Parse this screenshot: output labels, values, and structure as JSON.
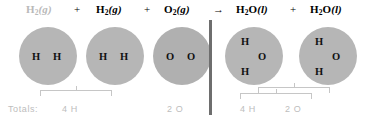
{
  "equation": {
    "reactants": [
      {
        "id": "h2-a",
        "formula": "H",
        "sub": "2",
        "state": "(g)",
        "faded": true
      },
      {
        "id": "h2-b",
        "formula": "H",
        "sub": "2",
        "state": "(g)",
        "faded": false
      },
      {
        "id": "o2",
        "formula": "O",
        "sub": "2",
        "state": "(g)",
        "faded": false
      }
    ],
    "products": [
      {
        "id": "h2o-a",
        "formula": "H",
        "sub": "2",
        "state": "(l)",
        "suffix": "O",
        "faded": false
      },
      {
        "id": "h2o-b",
        "formula": "H",
        "sub": "2",
        "state": "(l)",
        "suffix": "O",
        "faded": false
      }
    ],
    "labels": {
      "h2_a": "H2(g)",
      "h2_b": "H2(g)",
      "o2": "O2(g)",
      "h2o_a": "H2O(l)",
      "h2o_b": "H2O(l)"
    },
    "operators": {
      "plus1": "+",
      "plus2": "+",
      "arrow": "→",
      "plus3": "+"
    }
  },
  "molecules": [
    {
      "name": "hydrogen-molecule-1",
      "atoms": [
        "H",
        "H"
      ]
    },
    {
      "name": "hydrogen-molecule-2",
      "atoms": [
        "H",
        "H"
      ]
    },
    {
      "name": "oxygen-molecule",
      "atoms": [
        "O",
        "O"
      ]
    },
    {
      "name": "water-molecule-1",
      "atoms": [
        "H",
        "O",
        "H"
      ]
    },
    {
      "name": "water-molecule-2",
      "atoms": [
        "H",
        "O",
        "H"
      ]
    }
  ],
  "atom_labels": {
    "h": "H",
    "o": "O"
  },
  "totals": {
    "prefix": "Totals:",
    "reactant_hydrogen": "4 H",
    "reactant_oxygen": "2 O",
    "product_hydrogen": "4 H",
    "product_oxygen": "2 O"
  },
  "colors": {
    "molecule_fill": "#b6b6b6",
    "oxygen_fill": "#b0b0b0",
    "divider": "#6e6e6e",
    "bracket": "#c6c6c6",
    "totals_text": "#bdbdbd",
    "faded_formula": "#b9b9b9",
    "atom_text": "#111111"
  }
}
